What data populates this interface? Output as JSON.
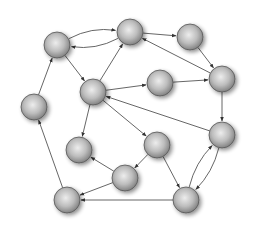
{
  "diagram": {
    "type": "directed-graph",
    "node_radius": 13,
    "colors": {
      "background": "#ffffff",
      "node_light": "#e8e8e8",
      "node_dark": "#8a8a8a",
      "node_stroke": "#555555",
      "edge": "#555555"
    },
    "nodes": [
      {
        "id": "A",
        "x": 57,
        "y": 45
      },
      {
        "id": "B",
        "x": 130,
        "y": 32
      },
      {
        "id": "C",
        "x": 190,
        "y": 37
      },
      {
        "id": "D",
        "x": 93,
        "y": 92
      },
      {
        "id": "E",
        "x": 160,
        "y": 83
      },
      {
        "id": "F",
        "x": 222,
        "y": 79
      },
      {
        "id": "G",
        "x": 34,
        "y": 107
      },
      {
        "id": "H",
        "x": 79,
        "y": 150
      },
      {
        "id": "I",
        "x": 157,
        "y": 145
      },
      {
        "id": "J",
        "x": 222,
        "y": 135
      },
      {
        "id": "K",
        "x": 125,
        "y": 178
      },
      {
        "id": "L",
        "x": 67,
        "y": 200
      },
      {
        "id": "M",
        "x": 186,
        "y": 200
      }
    ],
    "edges": [
      {
        "from": "A",
        "to": "B",
        "curve": -12
      },
      {
        "from": "B",
        "to": "A",
        "curve": -12
      },
      {
        "from": "G",
        "to": "A",
        "curve": 0
      },
      {
        "from": "A",
        "to": "D",
        "curve": 0
      },
      {
        "from": "D",
        "to": "B",
        "curve": 0
      },
      {
        "from": "B",
        "to": "C",
        "curve": 0
      },
      {
        "from": "F",
        "to": "B",
        "curve": 0
      },
      {
        "from": "C",
        "to": "F",
        "curve": 0
      },
      {
        "from": "D",
        "to": "E",
        "curve": 0
      },
      {
        "from": "E",
        "to": "F",
        "curve": 0
      },
      {
        "from": "D",
        "to": "H",
        "curve": 0
      },
      {
        "from": "D",
        "to": "I",
        "curve": 0
      },
      {
        "from": "J",
        "to": "D",
        "curve": 0
      },
      {
        "from": "F",
        "to": "J",
        "curve": 0
      },
      {
        "from": "I",
        "to": "K",
        "curve": 0
      },
      {
        "from": "K",
        "to": "H",
        "curve": 0
      },
      {
        "from": "K",
        "to": "L",
        "curve": 0
      },
      {
        "from": "M",
        "to": "L",
        "curve": 0
      },
      {
        "from": "L",
        "to": "G",
        "curve": 0
      },
      {
        "from": "I",
        "to": "M",
        "curve": 0
      },
      {
        "from": "M",
        "to": "J",
        "curve": -10
      },
      {
        "from": "J",
        "to": "M",
        "curve": -10
      }
    ]
  }
}
